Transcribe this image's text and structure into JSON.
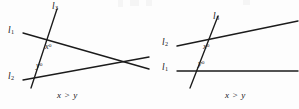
{
  "figure": {
    "type": "geometry-diagram-pair",
    "background_color": "#fdfdfd",
    "ink_color": "#1b1b1b"
  },
  "panels": [
    {
      "id": "left",
      "caption": "x > y",
      "description": "Transversal l3 crosses two lines l1 and l2 that converge to the right",
      "line_labels": [
        {
          "key": "l3",
          "text": "l",
          "sub": "3"
        },
        {
          "key": "l1",
          "text": "l",
          "sub": "1"
        },
        {
          "key": "l2",
          "text": "l",
          "sub": "2"
        }
      ],
      "angle_labels": [
        {
          "key": "x",
          "text": "x",
          "sup": "o"
        },
        {
          "key": "y",
          "text": "y",
          "sup": "o"
        }
      ]
    },
    {
      "id": "right",
      "caption": "x > y",
      "description": "Transversal l3 crosses line l2 rising to the right and horizontal line l1",
      "line_labels": [
        {
          "key": "l3",
          "text": "l",
          "sub": "3"
        },
        {
          "key": "l2",
          "text": "l",
          "sub": "2"
        },
        {
          "key": "l1",
          "text": "l",
          "sub": "1"
        }
      ],
      "angle_labels": [
        {
          "key": "x",
          "text": "x",
          "sup": "o"
        },
        {
          "key": "y",
          "text": "y",
          "sup": "o"
        }
      ]
    }
  ]
}
